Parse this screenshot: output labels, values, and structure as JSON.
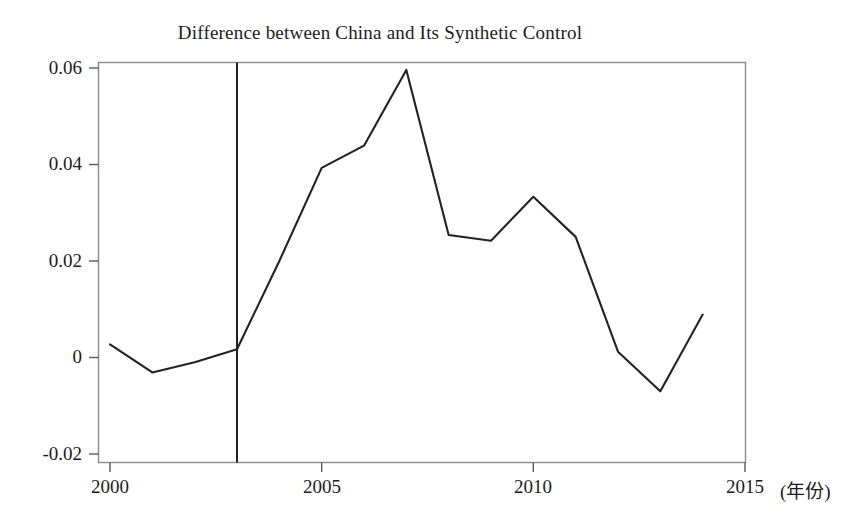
{
  "chart_data": {
    "type": "line",
    "title": "Difference between China and Its Synthetic Control",
    "xlabel": "",
    "ylabel": "",
    "x_unit_label": "(年份)",
    "x": [
      2000,
      2001,
      2002,
      2003,
      2004,
      2005,
      2006,
      2007,
      2008,
      2009,
      2010,
      2011,
      2012,
      2013,
      2014
    ],
    "values": [
      0.0027,
      -0.0031,
      -0.001,
      0.0017,
      0.02,
      0.0393,
      0.0439,
      0.0596,
      0.0254,
      0.0242,
      0.0333,
      0.025,
      0.0012,
      -0.007,
      0.0089
    ],
    "series": [
      {
        "name": "Difference (China - Synthetic Control)",
        "values": [
          0.0027,
          -0.0031,
          -0.001,
          0.0017,
          0.02,
          0.0393,
          0.0439,
          0.0596,
          0.0254,
          0.0242,
          0.0333,
          0.025,
          0.0012,
          -0.007,
          0.0089
        ]
      }
    ],
    "xlim": [
      2000,
      2015
    ],
    "ylim": [
      -0.02,
      0.06
    ],
    "x_ticks": [
      2000,
      2005,
      2010,
      2015
    ],
    "x_tick_labels": [
      "2000",
      "2005",
      "2010",
      "2015"
    ],
    "y_ticks": [
      -0.02,
      0,
      0.02,
      0.04,
      0.06
    ],
    "y_tick_labels": [
      "-0.02",
      "0",
      "0.02",
      "0.04",
      "0.06"
    ],
    "grid": false,
    "legend": "none",
    "annotations": [
      {
        "type": "vertical-line",
        "name": "intervention-line",
        "x": 2003,
        "label": ""
      }
    ],
    "line_color": "#222222",
    "frame_color": "#808080",
    "background_color": "#ffffff"
  }
}
